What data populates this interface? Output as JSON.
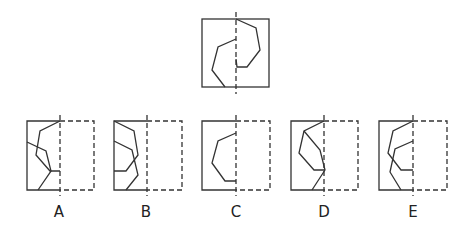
{
  "question": {
    "description": "Fold figure along dashed line; choose result",
    "stroke_color": "#333333"
  },
  "options": [
    {
      "label": "A",
      "x": 59
    },
    {
      "label": "B",
      "x": 146
    },
    {
      "label": "C",
      "x": 236
    },
    {
      "label": "D",
      "x": 324
    },
    {
      "label": "E",
      "x": 413
    }
  ]
}
